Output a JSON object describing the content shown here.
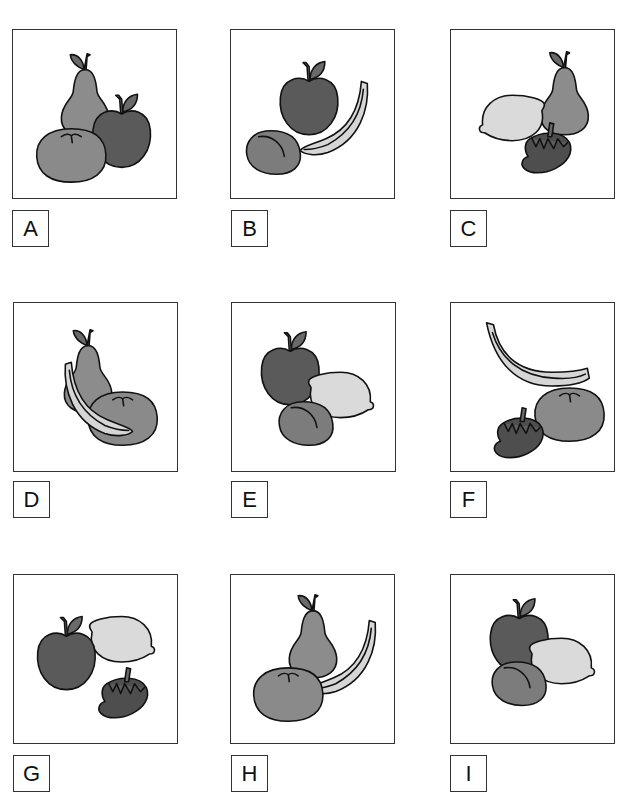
{
  "colors": {
    "apple": "#5a5a5a",
    "pear": "#8c8c8c",
    "orange": "#8a8a8a",
    "lemon": "#dadada",
    "banana": "#d6d6d6",
    "strawberry": "#4e4e4e",
    "plum": "#7c7c7c",
    "leaf": "#6a6a6a",
    "outline": "#111111"
  },
  "panels": [
    {
      "id": "A",
      "label": "A",
      "fruits": [
        "pear",
        "apple",
        "orange"
      ]
    },
    {
      "id": "B",
      "label": "B",
      "fruits": [
        "apple",
        "banana",
        "plum"
      ]
    },
    {
      "id": "C",
      "label": "C",
      "fruits": [
        "pear",
        "lemon",
        "strawberry"
      ]
    },
    {
      "id": "D",
      "label": "D",
      "fruits": [
        "pear",
        "orange",
        "banana"
      ]
    },
    {
      "id": "E",
      "label": "E",
      "fruits": [
        "apple",
        "lemon",
        "plum"
      ]
    },
    {
      "id": "F",
      "label": "F",
      "fruits": [
        "banana",
        "orange",
        "strawberry"
      ]
    },
    {
      "id": "G",
      "label": "G",
      "fruits": [
        "apple",
        "lemon",
        "strawberry"
      ]
    },
    {
      "id": "H",
      "label": "H",
      "fruits": [
        "pear",
        "banana",
        "orange"
      ]
    },
    {
      "id": "I",
      "label": "I",
      "fruits": [
        "apple",
        "lemon",
        "plum"
      ]
    }
  ]
}
